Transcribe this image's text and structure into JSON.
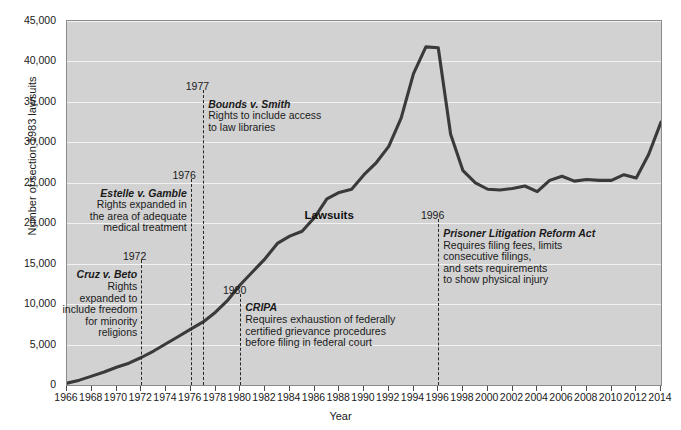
{
  "chart_data": {
    "type": "line",
    "title": "",
    "xlabel": "Year",
    "ylabel": "Number of section 1983 lawsuits",
    "xlim": [
      1966,
      2014
    ],
    "ylim": [
      0,
      45000
    ],
    "grid": true,
    "legend": "inline-label",
    "series": [
      {
        "name": "Lawsuits",
        "x": [
          1966,
          1967,
          1968,
          1969,
          1970,
          1971,
          1972,
          1973,
          1974,
          1975,
          1976,
          1977,
          1978,
          1979,
          1980,
          1981,
          1982,
          1983,
          1984,
          1985,
          1986,
          1987,
          1988,
          1989,
          1990,
          1991,
          1992,
          1993,
          1994,
          1995,
          1996,
          1997,
          1998,
          1999,
          2000,
          2001,
          2002,
          2003,
          2004,
          2005,
          2006,
          2007,
          2008,
          2009,
          2010,
          2011,
          2012,
          2013,
          2014
        ],
        "values": [
          220,
          600,
          1100,
          1600,
          2200,
          2700,
          3400,
          4200,
          5100,
          6000,
          6900,
          7800,
          9000,
          10500,
          12400,
          14000,
          15600,
          17500,
          18400,
          19000,
          20700,
          23000,
          23800,
          24200,
          26000,
          27500,
          29500,
          33000,
          38500,
          41800,
          41700,
          31000,
          26500,
          25000,
          24200,
          24100,
          24300,
          24600,
          23900,
          25300,
          25800,
          25200,
          25400,
          25300,
          25300,
          26000,
          25600,
          28500,
          32500
        ]
      }
    ],
    "yticks": [
      "0",
      "5,000",
      "10,000",
      "15,000",
      "20,000",
      "25,000",
      "30,000",
      "35,000",
      "40,000",
      "45,000"
    ],
    "ytick_values": [
      0,
      5000,
      10000,
      15000,
      20000,
      25000,
      30000,
      35000,
      40000,
      45000
    ],
    "xticks": [
      "1966",
      "1968",
      "1970",
      "1972",
      "1974",
      "1976",
      "1978",
      "1980",
      "1982",
      "1984",
      "1986",
      "1988",
      "1990",
      "1992",
      "1994",
      "1996",
      "1998",
      "2000",
      "2002",
      "2004",
      "2006",
      "2008",
      "2010",
      "2012",
      "2014"
    ],
    "xtick_values": [
      1966,
      1968,
      1970,
      1972,
      1974,
      1976,
      1978,
      1980,
      1982,
      1984,
      1986,
      1988,
      1990,
      1992,
      1994,
      1996,
      1998,
      2000,
      2002,
      2004,
      2006,
      2008,
      2010,
      2012,
      2014
    ],
    "series_label": "Lawsuits",
    "annotations": [
      {
        "id": "cruz-v-beto",
        "year_label": "1972",
        "x_value": 1972,
        "title": "Cruz v. Beto",
        "text": "Rights expanded to include freedom for minority religions",
        "lines": [
          "Rights",
          "expanded to",
          "include freedom",
          "for minority",
          "religions"
        ],
        "align": "right-aligned",
        "dash_top_value": 15500,
        "dash_bottom_value": 0
      },
      {
        "id": "estelle-v-gamble",
        "year_label": "1976",
        "x_value": 1976,
        "title": "Estelle v. Gamble",
        "text": "Rights expanded in the area of adequate medical treatment",
        "lines": [
          "Rights expanded in",
          "the area of adequate",
          "medical treatment"
        ],
        "align": "right-aligned",
        "dash_top_value": 25500,
        "dash_bottom_value": 0
      },
      {
        "id": "bounds-v-smith",
        "year_label": "1977",
        "x_value": 1977,
        "title": "Bounds v. Smith",
        "text": "Rights to include access to law libraries",
        "lines": [
          "Rights to include access",
          "to law libraries"
        ],
        "align": "left-aligned",
        "dash_top_value": 36500,
        "dash_bottom_value": 0
      },
      {
        "id": "cripa",
        "year_label": "1980",
        "x_value": 1980,
        "title": "CRIPA",
        "text": "Requires exhaustion of federally certified grievance procedures before filing in federal court",
        "lines": [
          "Requires exhaustion of federally",
          "certified grievance procedures",
          "before filing in federal court"
        ],
        "align": "left-aligned",
        "dash_top_value": 11300,
        "dash_bottom_value": 0
      },
      {
        "id": "prisoner-litigation-reform-act",
        "year_label": "1996",
        "x_value": 1996,
        "title": "Prisoner Litigation Reform Act",
        "text": "Requires filing fees, limits consecutive filings, and sets requirements to show physical injury",
        "lines": [
          "Requires filing fees, limits",
          "consecutive filings,",
          "and sets requirements",
          "to show physical injury"
        ],
        "align": "left-aligned",
        "dash_top_value": 20500,
        "dash_bottom_value": 0
      }
    ]
  },
  "colors": {
    "plot_background": "#d2d2d2",
    "gridline": "#f2f2f2",
    "line": "#3a3a3a",
    "dash": "#262626",
    "text": "#1a1a1a",
    "page_background": "#ffffff"
  }
}
